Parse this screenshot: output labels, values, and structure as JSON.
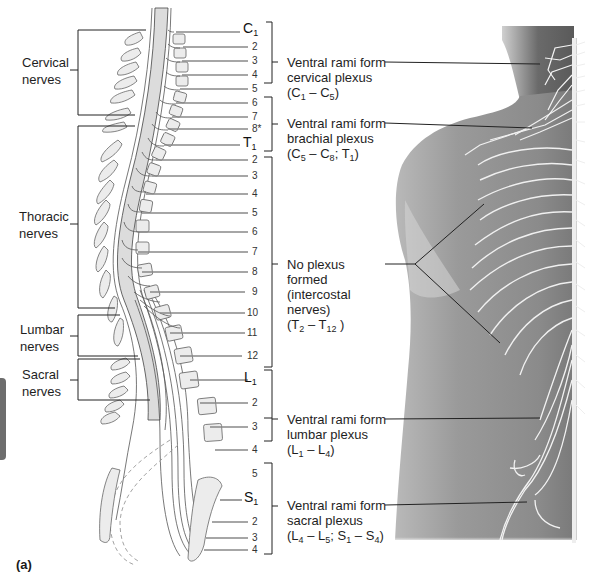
{
  "figure": {
    "panel_label": "(a)",
    "colors": {
      "line": "#333333",
      "cord_fill": "#d9d9d9",
      "vertebra_fill": "#ebebeb",
      "body_shade": "#8a8a8a",
      "nerve_white": "#f2f2f2",
      "side_tab": "#6d6d6d"
    }
  },
  "left_groups": [
    {
      "name": "cervical",
      "line1": "Cervical",
      "line2": "nerves"
    },
    {
      "name": "thoracic",
      "line1": "Thoracic",
      "line2": "nerves"
    },
    {
      "name": "lumbar",
      "line1": "Lumbar",
      "line2": "nerves"
    },
    {
      "name": "sacral",
      "line1": "Sacral",
      "line2": "nerves"
    }
  ],
  "spinal_levels": {
    "cervical": [
      {
        "letter": "C",
        "sub": "1"
      },
      {
        "letter": "",
        "sub": "",
        "num": "2"
      },
      {
        "num": "3"
      },
      {
        "num": "4"
      },
      {
        "num": "5"
      },
      {
        "num": "6"
      },
      {
        "num": "7"
      },
      {
        "num": "8*"
      }
    ],
    "thoracic": [
      {
        "letter": "T",
        "sub": "1"
      },
      {
        "num": "2"
      },
      {
        "num": "3"
      },
      {
        "num": "4"
      },
      {
        "num": "5"
      },
      {
        "num": "6"
      },
      {
        "num": "7"
      },
      {
        "num": "8"
      },
      {
        "num": "9"
      },
      {
        "num": "10"
      },
      {
        "num": "11"
      },
      {
        "num": "12"
      }
    ],
    "lumbar": [
      {
        "letter": "L",
        "sub": "1"
      },
      {
        "num": "2"
      },
      {
        "num": "3"
      },
      {
        "num": "4"
      },
      {
        "num": "5"
      }
    ],
    "sacral": [
      {
        "letter": "S",
        "sub": "1"
      },
      {
        "num": "2"
      },
      {
        "num": "3"
      },
      {
        "num": "4"
      }
    ]
  },
  "labels": {
    "c1": "C",
    "c1_sub": "1",
    "n2": "2",
    "n3": "3",
    "n4": "4",
    "n5": "5",
    "n6": "6",
    "n7": "7",
    "n8s": "8*",
    "t1": "T",
    "t1_sub": "1",
    "t2": "2",
    "t3": "3",
    "t4": "4",
    "t5": "5",
    "t6": "6",
    "t7": "7",
    "t8": "8",
    "t9": "9",
    "t10": "10",
    "t11": "11",
    "t12": "12",
    "l1": "L",
    "l1_sub": "1",
    "l2": "2",
    "l3": "3",
    "l4": "4",
    "l5": "5",
    "s1": "S",
    "s1_sub": "1",
    "s2": "2",
    "s3": "3",
    "s4": "4"
  },
  "plexus_annotations": [
    {
      "name": "cervical-plexus",
      "line1": "Ventral rami form",
      "line2": "cervical plexus",
      "range": {
        "a": "C",
        "a_sub": "1",
        "sep": " – ",
        "b": "C",
        "b_sub": "5",
        "tail": ")"
      }
    },
    {
      "name": "brachial-plexus",
      "line1": "Ventral rami form",
      "line2": "brachial plexus",
      "range": {
        "a": "C",
        "a_sub": "5",
        "sep": " – ",
        "b": "C",
        "b_sub": "8",
        "mid": "; ",
        "c": "T",
        "c_sub": "1",
        "tail": ")"
      }
    },
    {
      "name": "no-plexus",
      "line1": "No plexus",
      "line2": "formed",
      "line3": "(intercostal",
      "line4": "nerves)",
      "range": {
        "a": "T",
        "a_sub": "2",
        "sep": " – ",
        "b": "T",
        "b_sub": "12",
        "tail": " )"
      }
    },
    {
      "name": "lumbar-plexus",
      "line1": "Ventral rami form",
      "line2": "lumbar plexus",
      "range": {
        "a": "L",
        "a_sub": "1",
        "sep": " – ",
        "b": "L",
        "b_sub": "4",
        "tail": ")"
      }
    },
    {
      "name": "sacral-plexus",
      "line1": "Ventral rami form",
      "line2": "sacral plexus",
      "range": {
        "a": "L",
        "a_sub": "4",
        "sep": " – ",
        "b": "L",
        "b_sub": "5",
        "mid": "; ",
        "c": "S",
        "c_sub": "1",
        "sep2": " – ",
        "d": "S",
        "d_sub": "4",
        "tail": ")"
      }
    }
  ]
}
